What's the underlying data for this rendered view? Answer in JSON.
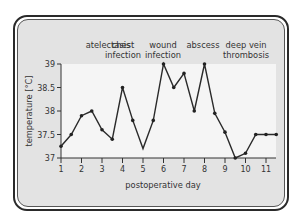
{
  "chart_data": {
    "type": "line",
    "title": "",
    "xlabel": "postoperative day",
    "ylabel": "temperature [°C]",
    "xlim": [
      1,
      11.5
    ],
    "ylim": [
      37,
      39
    ],
    "x_ticks": [
      1,
      2,
      3,
      4,
      5,
      6,
      7,
      8,
      9,
      10,
      11
    ],
    "y_ticks": [
      37,
      37.5,
      38,
      38.5,
      39
    ],
    "y_tick_labels": [
      "37",
      "37.5",
      "38",
      "38.5",
      "39"
    ],
    "grid": false,
    "legend": null,
    "series": [
      {
        "name": "temperature",
        "x": [
          1,
          1.5,
          2,
          2.5,
          3,
          3.5,
          4,
          4.5,
          5,
          5.5,
          6,
          6.5,
          7,
          7.5,
          8,
          8.5,
          9,
          9.5,
          10,
          10.5,
          11,
          11.5
        ],
        "values": [
          37.25,
          37.5,
          37.9,
          38.0,
          37.6,
          37.4,
          38.5,
          37.8,
          37.2,
          37.8,
          39.0,
          38.5,
          38.8,
          38.0,
          39.0,
          37.95,
          37.55,
          37.0,
          37.1,
          37.5,
          37.5,
          37.5
        ]
      }
    ],
    "annotations": [
      {
        "text": [
          "atelectasis"
        ],
        "x_day": 2.1
      },
      {
        "text": [
          "chest",
          "infection"
        ],
        "x_day": 4.0
      },
      {
        "text": [
          "wound",
          "infection"
        ],
        "x_day": 5.9
      },
      {
        "text": [
          "abscess"
        ],
        "x_day": 7.9
      },
      {
        "text": [
          "deep vein",
          "thrombosis"
        ],
        "x_day": 10.0
      }
    ]
  },
  "labels": {
    "xlabel": "postoperative day",
    "ylabel": "temperature [°C]",
    "ann1": "atelectasis",
    "ann2a": "chest",
    "ann2b": "infection",
    "ann3a": "wound",
    "ann3b": "infection",
    "ann4": "abscess",
    "ann5a": "deep vein",
    "ann5b": "thrombosis"
  }
}
